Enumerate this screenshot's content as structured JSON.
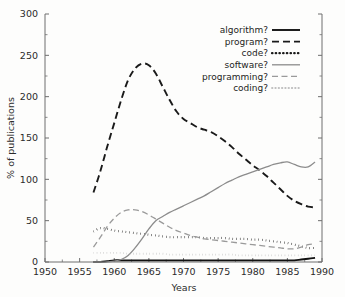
{
  "chart_data": {
    "type": "line",
    "title": "",
    "xlabel": "Years",
    "ylabel": "% of publications",
    "xlim": [
      1950,
      1990
    ],
    "ylim": [
      0,
      300
    ],
    "grid": false,
    "legend_position": "top-right",
    "xticks": [
      1950,
      1955,
      1960,
      1965,
      1970,
      1975,
      1980,
      1985,
      1990
    ],
    "xtick_labels": [
      "1950",
      "1955",
      "1960",
      "1965",
      "1970",
      "1975",
      "1980",
      "1985",
      "1990"
    ],
    "yticks": [
      0,
      50,
      100,
      150,
      200,
      250,
      300
    ],
    "ytick_labels": [
      "0",
      "50",
      "100",
      "150",
      "200",
      "250",
      "300"
    ],
    "yminor_ticks": [
      25,
      75,
      125,
      175,
      225,
      275
    ],
    "series": [
      {
        "name": "algorithm?",
        "label": "algorithm?",
        "color": "#111111",
        "style": "solid",
        "width": 1.9,
        "x": [
          1957,
          1958,
          1959,
          1960,
          1961,
          1962,
          1963,
          1964,
          1965,
          1966,
          1967,
          1968,
          1969,
          1970,
          1971,
          1972,
          1973,
          1974,
          1975,
          1976,
          1977,
          1978,
          1979,
          1980,
          1981,
          1982,
          1983,
          1984,
          1985,
          1986,
          1987,
          1988,
          1989
        ],
        "values": [
          0,
          0,
          1,
          2,
          2,
          2,
          2,
          2,
          2,
          2,
          2,
          2,
          2,
          2,
          2,
          2,
          2,
          2,
          2,
          2,
          2,
          2,
          2,
          2,
          2,
          2,
          2,
          2,
          2,
          2,
          3,
          4,
          5
        ]
      },
      {
        "name": "program?",
        "label": "program?",
        "color": "#1a1a1a",
        "style": "dashed",
        "width": 1.9,
        "x": [
          1957,
          1958,
          1959,
          1960,
          1961,
          1962,
          1963,
          1964,
          1965,
          1966,
          1967,
          1968,
          1969,
          1970,
          1971,
          1972,
          1973,
          1974,
          1975,
          1976,
          1977,
          1978,
          1979,
          1980,
          1981,
          1982,
          1983,
          1984,
          1985,
          1986,
          1987,
          1988,
          1989
        ],
        "values": [
          84,
          110,
          140,
          168,
          196,
          220,
          234,
          240,
          238,
          228,
          212,
          196,
          182,
          173,
          168,
          163,
          160,
          157,
          152,
          146,
          139,
          131,
          124,
          117,
          111,
          104,
          96,
          88,
          80,
          74,
          70,
          67,
          66
        ]
      },
      {
        "name": "code?",
        "label": "code?",
        "color": "#1a1a1a",
        "style": "dotted",
        "width": 2.2,
        "x": [
          1957,
          1958,
          1959,
          1960,
          1961,
          1962,
          1963,
          1964,
          1965,
          1966,
          1967,
          1968,
          1969,
          1970,
          1971,
          1972,
          1973,
          1974,
          1975,
          1976,
          1977,
          1978,
          1979,
          1980,
          1981,
          1982,
          1983,
          1984,
          1985,
          1986,
          1987,
          1988,
          1989
        ],
        "values": [
          37,
          41,
          40,
          38,
          37,
          36,
          35,
          34,
          33,
          32,
          31,
          30,
          30,
          30,
          30,
          30,
          29,
          29,
          29,
          29,
          28,
          28,
          28,
          27,
          27,
          26,
          25,
          24,
          23,
          21,
          19,
          17,
          17
        ]
      },
      {
        "name": "software?",
        "label": "software?",
        "color": "#8c8c8c",
        "style": "solid",
        "width": 1.3,
        "x": [
          1957,
          1958,
          1959,
          1960,
          1961,
          1962,
          1963,
          1964,
          1965,
          1966,
          1967,
          1968,
          1969,
          1970,
          1971,
          1972,
          1973,
          1974,
          1975,
          1976,
          1977,
          1978,
          1979,
          1980,
          1981,
          1982,
          1983,
          1984,
          1985,
          1986,
          1987,
          1988,
          1989
        ],
        "values": [
          0,
          0,
          0,
          1,
          3,
          8,
          17,
          28,
          40,
          50,
          55,
          60,
          64,
          68,
          72,
          76,
          80,
          85,
          90,
          95,
          99,
          103,
          106,
          109,
          112,
          115,
          118,
          120,
          121,
          118,
          115,
          115,
          121
        ]
      },
      {
        "name": "programming?",
        "label": "programming?",
        "color": "#9a9a9a",
        "style": "dashed",
        "width": 1.3,
        "x": [
          1957,
          1958,
          1959,
          1960,
          1961,
          1962,
          1963,
          1964,
          1965,
          1966,
          1967,
          1968,
          1969,
          1970,
          1971,
          1972,
          1973,
          1974,
          1975,
          1976,
          1977,
          1978,
          1979,
          1980,
          1981,
          1982,
          1983,
          1984,
          1985,
          1986,
          1987,
          1988,
          1989
        ],
        "values": [
          18,
          30,
          43,
          53,
          60,
          63,
          63,
          61,
          57,
          52,
          47,
          42,
          38,
          35,
          32,
          30,
          28,
          27,
          26,
          25,
          24,
          23,
          22,
          21,
          20,
          19,
          18,
          17,
          16,
          16,
          18,
          21,
          22
        ]
      },
      {
        "name": "coding?",
        "label": "coding?",
        "color": "#c0c0c0",
        "style": "dotted",
        "width": 1.8,
        "x": [
          1957,
          1958,
          1959,
          1960,
          1961,
          1962,
          1963,
          1964,
          1965,
          1966,
          1967,
          1968,
          1969,
          1970,
          1971,
          1972,
          1973,
          1974,
          1975,
          1976,
          1977,
          1978,
          1979,
          1980,
          1981,
          1982,
          1983,
          1984,
          1985,
          1986,
          1987,
          1988,
          1989
        ],
        "values": [
          11,
          11,
          11,
          11,
          11,
          10,
          10,
          10,
          10,
          10,
          10,
          9,
          9,
          9,
          9,
          9,
          9,
          9,
          9,
          9,
          9,
          8,
          8,
          8,
          8,
          8,
          8,
          8,
          8,
          8,
          8,
          8,
          8
        ]
      }
    ]
  }
}
